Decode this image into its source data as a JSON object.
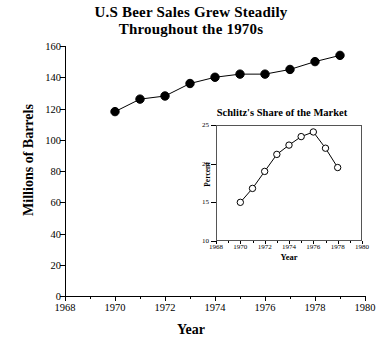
{
  "chart_data": [
    {
      "type": "line",
      "title": "U.S Beer Sales Grew Steadily Throughout the 1970s",
      "title_line1": "U.S Beer Sales Grew Steadily",
      "title_line2": "Throughout the 1970s",
      "xlabel": "Year",
      "ylabel": "Millions  of  Barrels",
      "xlim": [
        1968,
        1980
      ],
      "ylim": [
        0,
        160
      ],
      "yticks": [
        0,
        20,
        40,
        60,
        80,
        100,
        120,
        140,
        160
      ],
      "xticks": [
        1968,
        1970,
        1972,
        1974,
        1976,
        1978,
        1980
      ],
      "xminorticks": [
        1969,
        1971,
        1973,
        1975,
        1977,
        1979
      ],
      "grid": false,
      "legend": "none",
      "marker": "filled-circle",
      "x": [
        1970,
        1971,
        1972,
        1973,
        1974,
        1975,
        1976,
        1977,
        1978,
        1979
      ],
      "values": [
        118,
        126,
        128,
        136,
        140,
        142,
        142,
        145,
        150,
        154
      ]
    },
    {
      "type": "line",
      "title": "Schlitz's Share of the Market",
      "xlabel": "Year",
      "ylabel": "Percent",
      "xlim": [
        1968,
        1980
      ],
      "ylim": [
        10,
        25
      ],
      "yticks": [
        10,
        15,
        20,
        25
      ],
      "xticks": [
        1968,
        1970,
        1972,
        1974,
        1976,
        1978,
        1980
      ],
      "grid": false,
      "legend": "none",
      "marker": "open-circle",
      "x": [
        1970,
        1971,
        1972,
        1973,
        1974,
        1975,
        1976,
        1977,
        1978
      ],
      "values": [
        15.0,
        16.8,
        19.0,
        21.2,
        22.4,
        23.5,
        24.1,
        22.0,
        19.5
      ]
    }
  ],
  "colors": {
    "ink": "#000000",
    "frame": "#555555",
    "background": "#ffffff"
  }
}
